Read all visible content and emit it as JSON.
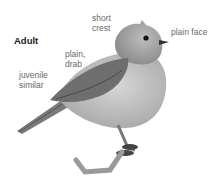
{
  "figure": {
    "title": "Adult",
    "annotations": [
      {
        "id": "short-crest",
        "text": "short\ncrest"
      },
      {
        "id": "plain-face",
        "text": "plain face"
      },
      {
        "id": "plain-drab",
        "text": "plain,\ndrab"
      },
      {
        "id": "juvenile-similar",
        "text": "juvenile\nsimilar"
      }
    ]
  }
}
